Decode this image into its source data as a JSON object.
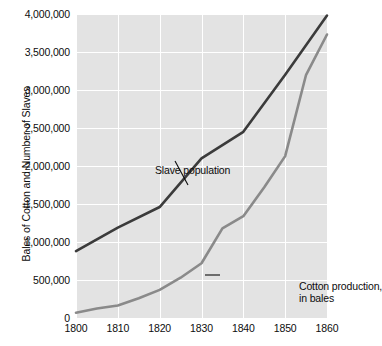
{
  "chart_data": {
    "type": "line",
    "title": "",
    "subtitle": "",
    "xlabel": "",
    "ylabel": "Bales of Cotton and Number of Slaves",
    "xlim": [
      1800,
      1860
    ],
    "ylim": [
      0,
      4000000
    ],
    "grid": true,
    "legend_position": "in-plot annotations",
    "x_ticks": [
      "1800",
      "1810",
      "1820",
      "1830",
      "1840",
      "1850",
      "1860"
    ],
    "x_tick_values": [
      1800,
      1810,
      1820,
      1830,
      1840,
      1850,
      1860
    ],
    "y_ticks": [
      "0",
      "500,000",
      "1,000,000",
      "1,500,000",
      "2,000,000",
      "2,500,000",
      "3,000,000",
      "3,500,000",
      "4,000,000"
    ],
    "y_tick_values": [
      0,
      500000,
      1000000,
      1500000,
      2000000,
      2500000,
      3000000,
      3500000,
      4000000
    ],
    "series": [
      {
        "name": "Slave population",
        "color": "#3b3b3b",
        "x": [
          1800,
          1810,
          1820,
          1830,
          1840,
          1850,
          1860
        ],
        "values": [
          880000,
          1190000,
          1460000,
          2100000,
          2450000,
          3200000,
          3980000
        ]
      },
      {
        "name": "Cotton production, in bales",
        "color": "#8a8a8a",
        "x": [
          1800,
          1805,
          1810,
          1815,
          1820,
          1825,
          1830,
          1835,
          1840,
          1845,
          1850,
          1855,
          1860
        ],
        "values": [
          70000,
          125000,
          165000,
          260000,
          370000,
          530000,
          720000,
          1180000,
          1340000,
          1720000,
          2130000,
          3200000,
          3730000
        ]
      }
    ],
    "annotations": [
      {
        "text": "Slave population",
        "x": 1800,
        "y": 2300000
      },
      {
        "text_line1": "Cotton production,",
        "text_line2": "in bales",
        "x": 1840,
        "y": 900000
      }
    ]
  },
  "annotations": {
    "slave_population": "Slave population",
    "cotton_line1": "Cotton production,",
    "cotton_line2": "in bales"
  },
  "axes": {
    "y_title": "Bales of Cotton and Number of Slaves"
  }
}
